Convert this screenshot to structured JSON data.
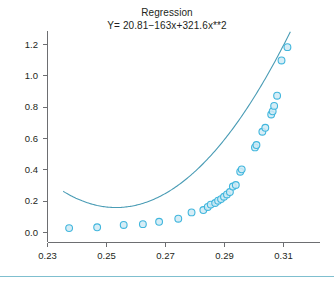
{
  "chart_data": {
    "type": "scatter",
    "title": "Regression",
    "subtitle": "Y= 20.81−163x+321.6x**2",
    "xlabel": "",
    "ylabel": "",
    "xlim": [
      0.2265,
      0.3145
    ],
    "ylim": [
      -0.05,
      1.27
    ],
    "grid": false,
    "legend": null,
    "x_ticks": [
      0.23,
      0.25,
      0.27,
      0.29,
      0.31
    ],
    "x_tick_labels": [
      "0.23",
      "0.25",
      "0.27",
      "0.29",
      "0.31"
    ],
    "y_ticks": [
      0.0,
      0.2,
      0.4,
      0.6,
      0.8,
      1.0,
      1.2
    ],
    "y_tick_labels": [
      "0.0",
      "0.2",
      "0.4",
      "0.6",
      "0.8",
      "1.0",
      "1.2"
    ],
    "marker": "open-circle",
    "marker_color": "#41b6dd",
    "marker_fill": "#cfeaf4",
    "curve_color": "#4a9cb5",
    "fit": {
      "equation": "Y= 20.81−163x+321.6x**2",
      "intercept": 20.81,
      "linear_coefficient": -163,
      "quadratic_coefficient": 321.6,
      "x_start": 0.2355,
      "x_end": 0.3125
    },
    "points": [
      {
        "x": 0.2375,
        "y": 0.025
      },
      {
        "x": 0.247,
        "y": 0.03
      },
      {
        "x": 0.256,
        "y": 0.045
      },
      {
        "x": 0.2625,
        "y": 0.05
      },
      {
        "x": 0.268,
        "y": 0.065
      },
      {
        "x": 0.2745,
        "y": 0.085
      },
      {
        "x": 0.279,
        "y": 0.125
      },
      {
        "x": 0.283,
        "y": 0.14
      },
      {
        "x": 0.2845,
        "y": 0.16
      },
      {
        "x": 0.2855,
        "y": 0.175
      },
      {
        "x": 0.287,
        "y": 0.185
      },
      {
        "x": 0.288,
        "y": 0.2
      },
      {
        "x": 0.289,
        "y": 0.21
      },
      {
        "x": 0.29,
        "y": 0.225
      },
      {
        "x": 0.291,
        "y": 0.24
      },
      {
        "x": 0.292,
        "y": 0.255
      },
      {
        "x": 0.293,
        "y": 0.29
      },
      {
        "x": 0.294,
        "y": 0.3
      },
      {
        "x": 0.2955,
        "y": 0.385
      },
      {
        "x": 0.296,
        "y": 0.4
      },
      {
        "x": 0.3005,
        "y": 0.54
      },
      {
        "x": 0.301,
        "y": 0.555
      },
      {
        "x": 0.303,
        "y": 0.64
      },
      {
        "x": 0.304,
        "y": 0.665
      },
      {
        "x": 0.306,
        "y": 0.75
      },
      {
        "x": 0.3065,
        "y": 0.77
      },
      {
        "x": 0.307,
        "y": 0.805
      },
      {
        "x": 0.308,
        "y": 0.87
      },
      {
        "x": 0.3095,
        "y": 1.095
      },
      {
        "x": 0.3115,
        "y": 1.18
      }
    ]
  },
  "figure": {
    "footer_rule_label": "footer-divider"
  }
}
